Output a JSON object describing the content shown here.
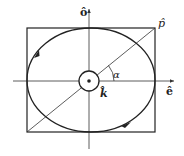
{
  "diagram": {
    "type": "elliptical-polarization",
    "labels": {
      "vertical_axis": "ô",
      "horizontal_axis": "ê",
      "diagonal": "p̂",
      "propagation": "k̂",
      "angle": "α"
    },
    "colors": {
      "stroke": "#222222",
      "thin_stroke": "#333333",
      "background": "#ffffff"
    },
    "elements": [
      "bounding-rectangle",
      "ellipse-with-direction-arrows",
      "horizontal-axis-arrow",
      "vertical-axis-arrow",
      "diagonal-line",
      "center-circle-with-dot",
      "angle-arc"
    ]
  }
}
